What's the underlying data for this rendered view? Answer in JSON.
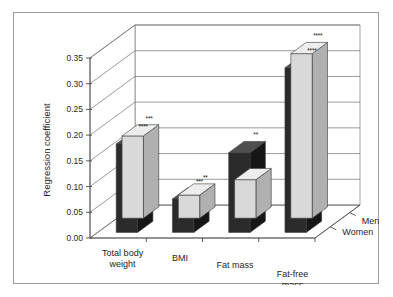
{
  "chart_data": {
    "type": "bar",
    "title": "Body composition components",
    "xlabel": "",
    "ylabel": "Regression coefficient",
    "ylim": [
      0.0,
      0.35
    ],
    "ytick_labels": [
      "0.00",
      "0.05",
      "0.10",
      "0.15",
      "0.20",
      "0.25",
      "0.30",
      "0.35"
    ],
    "ytick_values": [
      0.0,
      0.05,
      0.1,
      0.15,
      0.2,
      0.25,
      0.3,
      0.35
    ],
    "grid": true,
    "legend_position": "depth-axis-right",
    "three_d": true,
    "categories": [
      "Total body weight",
      "BMI",
      "Fat mass",
      "Fat-free mass"
    ],
    "series": [
      {
        "name": "Women",
        "color": "#d9d9d9",
        "values": [
          0.16,
          0.045,
          0.075,
          0.32
        ],
        "annotations": [
          "***",
          "**",
          "*",
          "****"
        ]
      },
      {
        "name": "Men",
        "color": "#2b2b2b",
        "values": [
          0.172,
          0.065,
          0.155,
          0.32
        ],
        "annotations": [
          "****",
          "***",
          "**",
          "****"
        ]
      }
    ]
  },
  "colors": {
    "frame_border": "#9a9a9a",
    "background": "#ffffff",
    "axis": "#4a4a4a",
    "grid": "#6e6e6e",
    "women_fill": "#d9d9d9",
    "women_side": "#b0b0b0",
    "women_top": "#ededed",
    "men_fill": "#2b2b2b",
    "men_side": "#161616",
    "men_top": "#4f4f4f"
  }
}
